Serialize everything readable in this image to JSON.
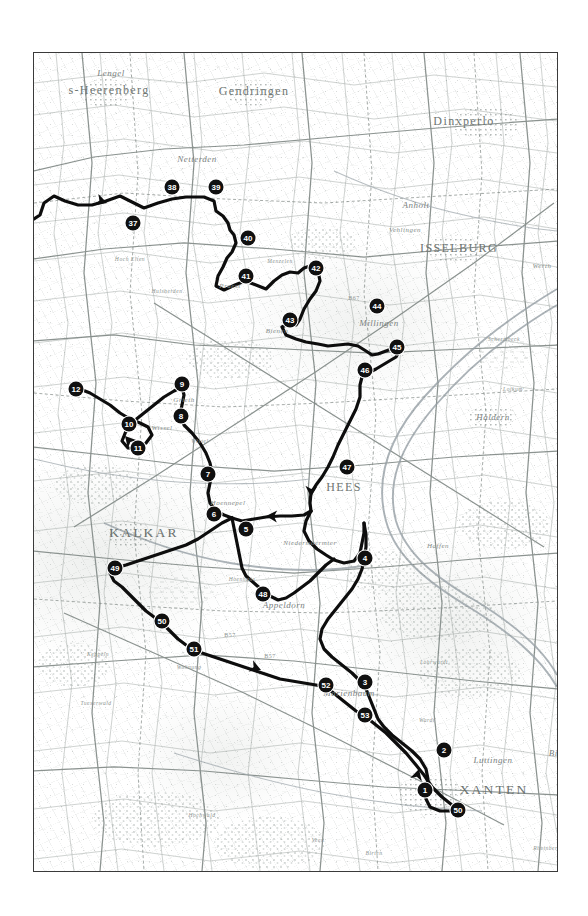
{
  "map": {
    "title": "Cycling route map — Lower Rhine / Achterhoek border region",
    "frame": {
      "x": 33,
      "y": 52,
      "width": 523,
      "height": 818
    },
    "colors": {
      "route": "#0d0d0d",
      "waypoint_fill": "#101010",
      "waypoint_text": "#ffffff",
      "frame_border": "#3a3a3a",
      "background": "#ffffff",
      "label_text": "#6f7673",
      "terrain_line": "#8b928f"
    },
    "waypoints": [
      {
        "id": "1",
        "label": "1",
        "x": 391,
        "y": 737
      },
      {
        "id": "2",
        "label": "2",
        "x": 410,
        "y": 697
      },
      {
        "id": "3",
        "label": "3",
        "x": 331,
        "y": 629
      },
      {
        "id": "4",
        "label": "4",
        "x": 331,
        "y": 505
      },
      {
        "id": "5",
        "label": "5",
        "x": 212,
        "y": 476
      },
      {
        "id": "6",
        "label": "6",
        "x": 180,
        "y": 461
      },
      {
        "id": "7",
        "label": "7",
        "x": 174,
        "y": 421
      },
      {
        "id": "8",
        "label": "8",
        "x": 147,
        "y": 363
      },
      {
        "id": "9",
        "label": "9",
        "x": 148,
        "y": 331
      },
      {
        "id": "10",
        "label": "10",
        "x": 95,
        "y": 371
      },
      {
        "id": "11",
        "label": "11",
        "x": 104,
        "y": 395
      },
      {
        "id": "12",
        "label": "12",
        "x": 42,
        "y": 336
      },
      {
        "id": "37",
        "label": "37",
        "x": 99,
        "y": 170
      },
      {
        "id": "38",
        "label": "38",
        "x": 138,
        "y": 134
      },
      {
        "id": "39",
        "label": "39",
        "x": 182,
        "y": 134
      },
      {
        "id": "40",
        "label": "40",
        "x": 214,
        "y": 185
      },
      {
        "id": "41",
        "label": "41",
        "x": 212,
        "y": 223
      },
      {
        "id": "42",
        "label": "42",
        "x": 282,
        "y": 215
      },
      {
        "id": "43",
        "label": "43",
        "x": 256,
        "y": 267
      },
      {
        "id": "44",
        "label": "44",
        "x": 343,
        "y": 253
      },
      {
        "id": "45",
        "label": "45",
        "x": 363,
        "y": 294
      },
      {
        "id": "46",
        "label": "46",
        "x": 331,
        "y": 317
      },
      {
        "id": "47",
        "label": "47",
        "x": 313,
        "y": 414
      },
      {
        "id": "48",
        "label": "48",
        "x": 229,
        "y": 541
      },
      {
        "id": "49",
        "label": "49",
        "x": 81,
        "y": 515
      },
      {
        "id": "50",
        "label": "50",
        "x": 128,
        "y": 568
      },
      {
        "id": "51",
        "label": "51",
        "x": 160,
        "y": 596
      },
      {
        "id": "52",
        "label": "52",
        "x": 292,
        "y": 632
      },
      {
        "id": "53",
        "label": "53",
        "x": 331,
        "y": 662
      },
      {
        "id": "50b",
        "label": "50",
        "x": 424,
        "y": 757
      }
    ],
    "places": [
      {
        "name": "Lengel",
        "x": 77,
        "y": 20,
        "style": "mid"
      },
      {
        "name": "s-Heerenberg",
        "x": 75,
        "y": 37,
        "style": "big"
      },
      {
        "name": "Gendringen",
        "x": 220,
        "y": 38,
        "style": "big"
      },
      {
        "name": "Dinxperlo",
        "x": 430,
        "y": 68,
        "style": "big"
      },
      {
        "name": "Anholt",
        "x": 382,
        "y": 152,
        "style": "mid"
      },
      {
        "name": "ISSELBURG",
        "x": 425,
        "y": 195,
        "style": "big"
      },
      {
        "name": "Netterden",
        "x": 163,
        "y": 106,
        "style": "mid"
      },
      {
        "name": "Vehlingen",
        "x": 371,
        "y": 177,
        "style": "small"
      },
      {
        "name": "Werth",
        "x": 508,
        "y": 213,
        "style": "small"
      },
      {
        "name": "Millingen",
        "x": 345,
        "y": 270,
        "style": "mid"
      },
      {
        "name": "Bienen",
        "x": 243,
        "y": 278,
        "style": "small"
      },
      {
        "name": "Praest",
        "x": 196,
        "y": 233,
        "style": "small"
      },
      {
        "name": "Haffen",
        "x": 404,
        "y": 493,
        "style": "small"
      },
      {
        "name": "Haldern",
        "x": 459,
        "y": 364,
        "style": "mid"
      },
      {
        "name": "HEES",
        "x": 310,
        "y": 434,
        "style": "big"
      },
      {
        "name": "KALKAR",
        "x": 110,
        "y": 480,
        "style": "major"
      },
      {
        "name": "Appeldorn",
        "x": 250,
        "y": 552,
        "style": "mid"
      },
      {
        "name": "Marienbaum",
        "x": 315,
        "y": 640,
        "style": "mid"
      },
      {
        "name": "XANTEN",
        "x": 460,
        "y": 737,
        "style": "major"
      },
      {
        "name": "Luttingen",
        "x": 459,
        "y": 707,
        "style": "mid"
      },
      {
        "name": "Bislich",
        "x": 529,
        "y": 700,
        "style": "mid"
      },
      {
        "name": "Wissel",
        "x": 128,
        "y": 375,
        "style": "small"
      },
      {
        "name": "Wissel",
        "x": 166,
        "y": 388,
        "style": "tiny"
      },
      {
        "name": "Grieth",
        "x": 150,
        "y": 347,
        "style": "small"
      },
      {
        "name": "Hoennepel",
        "x": 194,
        "y": 450,
        "style": "small"
      },
      {
        "name": "Niedermoermter",
        "x": 276,
        "y": 490,
        "style": "small"
      },
      {
        "name": "Huisberden",
        "x": 133,
        "y": 238,
        "style": "tiny"
      },
      {
        "name": "Hoch Elten",
        "x": 96,
        "y": 206,
        "style": "tiny"
      },
      {
        "name": "Keppeln",
        "x": 64,
        "y": 601,
        "style": "tiny"
      },
      {
        "name": "Hoenhaus",
        "x": 208,
        "y": 526,
        "style": "tiny"
      },
      {
        "name": "Wohnung",
        "x": 155,
        "y": 614,
        "style": "tiny"
      },
      {
        "name": "Veen",
        "x": 284,
        "y": 787,
        "style": "tiny"
      },
      {
        "name": "Birten",
        "x": 340,
        "y": 800,
        "style": "tiny"
      },
      {
        "name": "Wardt",
        "x": 393,
        "y": 667,
        "style": "tiny"
      },
      {
        "name": "Lohrwardt",
        "x": 400,
        "y": 609,
        "style": "tiny"
      },
      {
        "name": "Menzelen",
        "x": 246,
        "y": 208,
        "style": "tiny"
      },
      {
        "name": "Schermbeck",
        "x": 470,
        "y": 286,
        "style": "tiny"
      },
      {
        "name": "Loikum",
        "x": 479,
        "y": 336,
        "style": "tiny"
      },
      {
        "name": "Hochwald",
        "x": 168,
        "y": 762,
        "style": "tiny"
      },
      {
        "name": "Tuexerwald",
        "x": 62,
        "y": 650,
        "style": "tiny"
      },
      {
        "name": "Rheinberg",
        "x": 513,
        "y": 795,
        "style": "tiny"
      }
    ],
    "route": {
      "name": "main-cycling-route",
      "stroke_width": 3.2,
      "path": "M 0,166 L 6,162 L 10,150 L 20,143 L 31,148 L 44,152 L 58,152 L 72,148 L 86,143 L 96,148 L 110,155 L 124,150 L 138,146 L 152,144 L 170,144 L 180,148 L 182,158 L 189,163 L 194,170 L 196,177 L 200,182 L 202,190 L 198,199 L 193,205 L 189,214 L 184,223 L 182,233 L 190,237 L 201,232 L 211,228 L 222,232 L 232,236 L 240,228 L 248,222 L 256,219 L 264,220 L 270,215 L 276,213 L 284,218 L 286,228 L 282,238 L 276,246 L 270,256 L 266,266 L 262,272 L 254,271 L 248,274 L 252,282 L 262,286 L 272,289 L 284,291 L 294,293 L 304,292 L 314,291 L 324,293 L 332,298 L 338,302 L 344,301 L 352,298 L 360,295 L 366,297 L 362,304 L 352,310 L 342,316 L 334,320 L 328,324 L 326,332 L 326,344 L 322,356 L 316,368 L 310,380 L 304,392 L 299,404 L 294,414 L 288,424 L 282,432 L 277,440 L 276,450 L 277,458",
      "branches": [
        "M 277,458 L 270,462 L 258,463 L 246,463 L 232,464 L 220,466 L 208,468 L 198,465",
        "M 277,458 L 272,468 L 270,478 L 275,488 L 283,496 L 292,502 L 300,507 L 310,510 L 320,508 L 326,500 L 328,490 L 330,480 L 330,470",
        "M 198,465 L 190,462 L 182,458 L 176,450 L 174,440 L 176,430 L 178,420 L 176,410 L 172,400 L 166,390 L 158,380 L 150,372 L 146,362 L 148,352 L 150,342 L 148,334",
        "M 148,334 L 140,338 L 130,344 L 120,352 L 110,360 L 100,368 L 92,378 L 88,388 L 94,395 L 104,396 L 112,390 L 118,382 L 114,374 L 106,370 L 96,366 L 86,360 L 76,352 L 66,346 L 56,340 L 46,336 L 38,334",
        "M 330,470 L 332,482 L 332,494 L 330,506 L 328,516 L 324,526 L 318,536 L 310,546 L 302,556 L 294,566 L 288,576 L 286,586 L 290,596 L 298,604 L 308,612 L 318,620 L 326,628 L 332,636 L 336,646 L 340,656 L 344,666 L 350,674 L 358,682 L 368,690 L 378,698 L 386,706 L 392,716 L 394,726 L 392,736 L 392,746 L 396,754 L 406,758 L 416,758 L 424,757",
        "M 198,465 L 188,470 L 176,478 L 164,486 L 152,492 L 140,496 L 128,500 L 116,504 L 104,508 L 92,512 L 82,515 L 76,520 L 80,528 L 88,534 L 96,542 L 104,550 L 112,558 L 120,564 L 128,570 L 136,578 L 144,586 L 152,592 L 162,598 L 174,602 L 186,606 L 198,610 L 210,614 L 222,618 L 234,622 L 246,626 L 258,628 L 270,630 L 282,632 L 292,634 L 302,642 L 312,650 L 322,658 L 332,664 L 342,672 L 352,680 L 362,690 L 372,700 L 382,712 L 390,722 L 398,734 L 408,744 L 418,752 L 424,757",
        "M 198,465 L 200,475 L 202,485 L 204,495 L 206,505 L 208,515 L 212,523 L 220,530 L 228,537 L 236,543 L 244,547 L 252,545 L 260,540 L 268,534 L 276,528 L 284,520 L 292,512 L 300,506"
      ]
    },
    "arrows": [
      {
        "name": "arrow-route-east",
        "x": 73,
        "y": 150,
        "rotation": 18
      },
      {
        "name": "arrow-route-northwest",
        "x": 91,
        "y": 383,
        "rotation": -132
      },
      {
        "name": "arrow-route-south",
        "x": 277,
        "y": 444,
        "rotation": 92
      },
      {
        "name": "arrow-route-west",
        "x": 232,
        "y": 463,
        "rotation": 182
      },
      {
        "name": "arrow-route-southeast",
        "x": 227,
        "y": 617,
        "rotation": 22
      },
      {
        "name": "arrow-route-north",
        "x": 385,
        "y": 716,
        "rotation": -74
      }
    ],
    "road_labels": [
      {
        "name": "B57",
        "x": 196,
        "y": 582
      },
      {
        "name": "B57",
        "x": 236,
        "y": 603
      },
      {
        "name": "B67",
        "x": 320,
        "y": 245
      }
    ]
  }
}
